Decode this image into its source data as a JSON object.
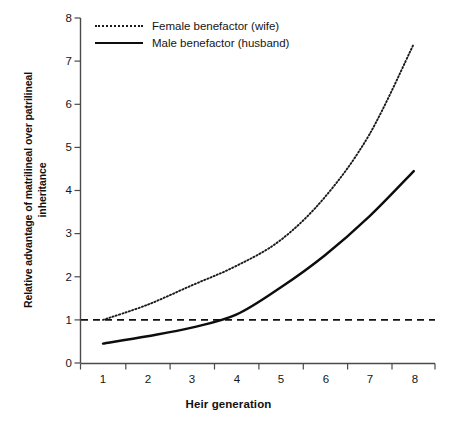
{
  "chart_data": {
    "type": "line",
    "title": "",
    "subtitle": "",
    "xlabel": "Heir generation",
    "ylabel": "Relative advantage of matrilineal over patrilineal inheritance",
    "ylabel_line1": "Relative advantage of matrilineal over patrilineal",
    "ylabel_line2": "inheritance",
    "x": [
      1,
      2,
      3,
      4,
      5,
      6,
      7,
      8
    ],
    "xtick_labels": [
      "1",
      "2",
      "3",
      "4",
      "5",
      "6",
      "7",
      "8"
    ],
    "ytick_labels": [
      "0",
      "1",
      "2",
      "3",
      "4",
      "5",
      "6",
      "7",
      "8"
    ],
    "xlim": [
      0.55,
      8.45
    ],
    "ylim": [
      0,
      8
    ],
    "grid": false,
    "legend_position": "top-left",
    "series": [
      {
        "name": "Female benefactor (wife)",
        "style": "dotted",
        "color": "#1a1a1a",
        "values": [
          1.0,
          1.35,
          1.8,
          2.25,
          2.85,
          3.85,
          5.3,
          7.4
        ]
      },
      {
        "name": "Male benefactor (husband)",
        "style": "solid",
        "color": "#0d0d0d",
        "values": [
          0.45,
          0.62,
          0.82,
          1.12,
          1.75,
          2.5,
          3.4,
          4.45
        ]
      }
    ],
    "reference_line": {
      "name": "parity-line",
      "value": 1,
      "style": "dashed",
      "color": "#111111"
    }
  },
  "axes": {
    "y_ticks": [
      "8",
      "7",
      "6",
      "5",
      "4",
      "3",
      "2",
      "1",
      "0"
    ],
    "x_ticks": [
      "1",
      "2",
      "3",
      "4",
      "5",
      "6",
      "7",
      "8"
    ]
  },
  "legend": {
    "items": [
      {
        "label": "Female benefactor (wife)",
        "style": "dotted"
      },
      {
        "label": "Male benefactor (husband)",
        "style": "solid"
      }
    ]
  },
  "colors": {
    "background": "#ffffff",
    "ink": "#111111",
    "axis": "#3a3a3a"
  }
}
